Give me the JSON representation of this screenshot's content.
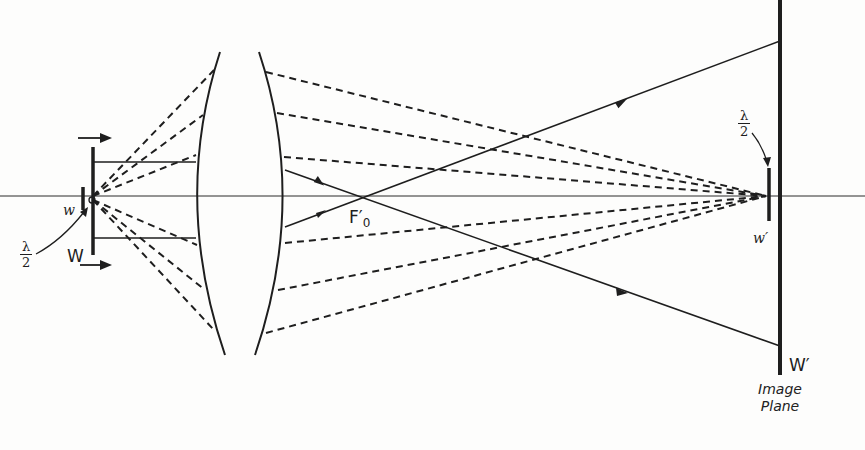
{
  "figure": {
    "colors": {
      "ink": "#1e1e1e",
      "background": "#fdfdfc"
    }
  },
  "labels": {
    "object_element": "w",
    "object_plane": "W",
    "focal_point_main": "F′",
    "focal_point_sub": "0",
    "image_element": "w′",
    "image_plane": "W′",
    "half_wavelength_left": {
      "numerator": "λ",
      "denominator": "2"
    },
    "half_wavelength_right": {
      "numerator": "λ",
      "denominator": "2"
    },
    "image_plane_caption": {
      "line1": "Image",
      "line2": "Plane"
    }
  },
  "elements": {
    "optical_axis": {
      "y": 196,
      "x_start": 0,
      "x_end": 865
    },
    "lens": {
      "left_surface_x_mid": 195,
      "right_surface_x_mid": 285,
      "top_y": 52,
      "bottom_y": 355
    },
    "object_plane_bar": {
      "x": 93,
      "y_top": 147,
      "y_bottom": 255
    },
    "object_element_bar": {
      "x": 83,
      "y_top": 187,
      "y_bottom": 210
    },
    "image_plane_bar": {
      "x": 780,
      "y_top": 0,
      "y_bottom": 375
    },
    "image_element_bar": {
      "x": 768,
      "y_top": 168,
      "y_bottom": 221
    },
    "motion_arrows": [
      "top-right-arrow",
      "bottom-right-arrow"
    ]
  }
}
